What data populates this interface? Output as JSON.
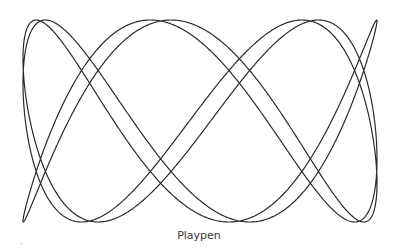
{
  "figure": {
    "caption": "Playpen",
    "stroke_color": "#2a2a2a",
    "background": "#ffffff"
  },
  "chart_data": {
    "type": "line",
    "title": "Playpen",
    "parametric": {
      "x": "sin(a*t + phase)",
      "y": "sin(b*t)",
      "a": 3,
      "b": 7,
      "phase": 0.06
    },
    "bounds_px": {
      "x_min": 23,
      "x_max": 377,
      "y_min": 20,
      "y_max": 222
    },
    "grid": false,
    "legend": null,
    "xlabel": "",
    "ylabel": ""
  }
}
